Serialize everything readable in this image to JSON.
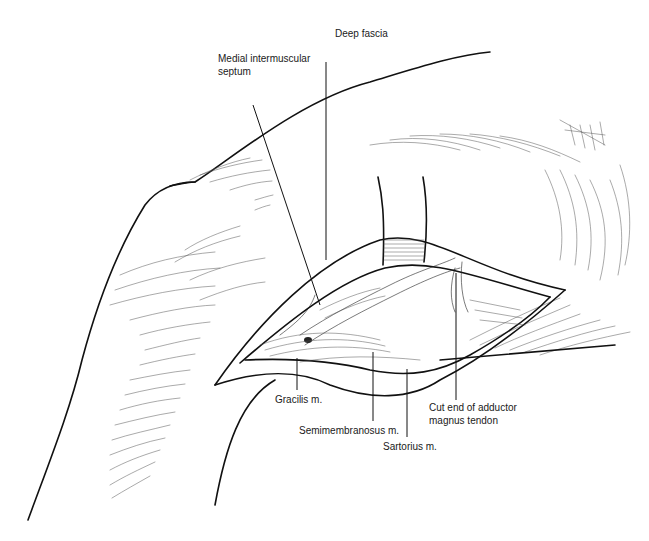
{
  "figure": {
    "colors": {
      "line": "#111111",
      "background": "#ffffff",
      "text": "#1a1a1a"
    },
    "labels": {
      "deep_fascia": "Deep fascia",
      "medial_intermuscular_septum_line1": "Medial intermuscular",
      "medial_intermuscular_septum_line2": "septum",
      "gracilis": "Gracilis m.",
      "semimembranosus": "Semimembranosus m.",
      "sartorius": "Sartorius m.",
      "adductor_line1": "Cut end of adductor",
      "adductor_line2": "magnus tendon"
    }
  }
}
